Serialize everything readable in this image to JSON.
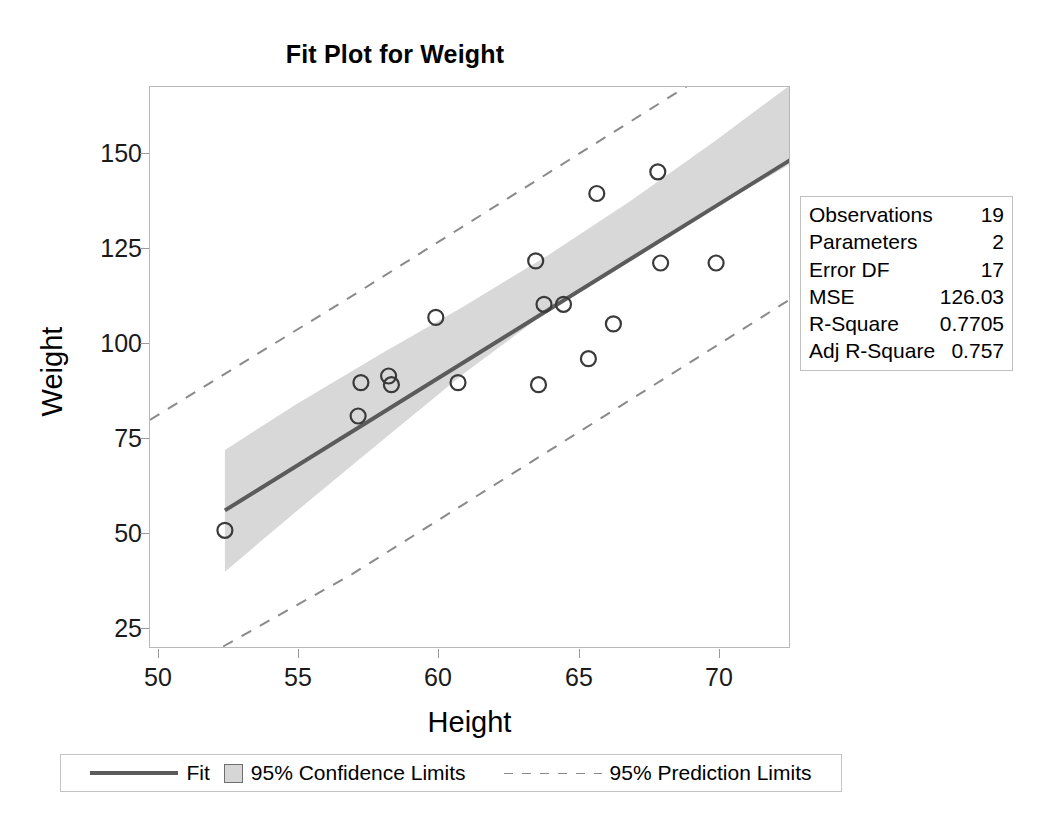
{
  "chart_data": {
    "type": "scatter",
    "title": "Fit Plot for Weight",
    "xlabel": "Height",
    "ylabel": "Weight",
    "xlim": [
      48.7,
      71.8
    ],
    "ylim": [
      23.2,
      152.5
    ],
    "xticks": [
      50,
      55,
      60,
      65,
      70
    ],
    "yticks": [
      25,
      50,
      75,
      100,
      125,
      150
    ],
    "grid": false,
    "legend_position": "bottom",
    "x": [
      51.4,
      56.2,
      56.3,
      57.3,
      57.4,
      59.0,
      59.8,
      62.6,
      62.7,
      62.9,
      63.6,
      64.5,
      64.8,
      65.4,
      67.0,
      67.1,
      69.1,
      72.1
    ],
    "y": [
      50.5,
      76.8,
      84.5,
      86.0,
      84.0,
      99.5,
      84.5,
      112.5,
      84.0,
      102.5,
      102.5,
      90.0,
      128.0,
      98.0,
      133.0,
      112.0,
      112.0,
      150.0
    ],
    "fit_line": {
      "x": [
        51.4,
        72.1
      ],
      "y": [
        55.1,
        137.0
      ],
      "color": "#5b5b5b"
    },
    "confidence_band": {
      "level": "95%",
      "x": [
        51.4,
        54.0,
        57.0,
        60.0,
        63.0,
        66.0,
        69.0,
        72.1
      ],
      "upper": [
        69.0,
        79.6,
        91.0,
        102.0,
        113.6,
        126.2,
        139.8,
        154.5
      ],
      "lower": [
        41.0,
        55.0,
        70.8,
        86.5,
        100.8,
        113.2,
        124.5,
        136.0
      ],
      "fill": "#d6d6d6"
    },
    "prediction_band": {
      "level": "95%",
      "x": [
        51.4,
        56.0,
        60.0,
        64.0,
        68.0,
        72.1
      ],
      "upper": [
        86.5,
        104.5,
        120.5,
        136.5,
        152.5,
        168.5
      ],
      "lower": [
        24.0,
        40.5,
        56.5,
        72.5,
        88.5,
        105.0
      ],
      "color": "#8a8a8a"
    },
    "marker": {
      "shape": "circle",
      "fill": "none",
      "edge": "#3a3a3a"
    }
  },
  "header": {
    "title": "Fit Plot for Weight"
  },
  "axes": {
    "y_label": "Weight",
    "x_label": "Height",
    "y_ticks": [
      "150",
      "125",
      "100",
      "75",
      "50",
      "25"
    ],
    "x_ticks": [
      "50",
      "55",
      "60",
      "65",
      "70"
    ]
  },
  "stats": {
    "rows": [
      {
        "label": "Observations",
        "value": "19"
      },
      {
        "label": "Parameters",
        "value": "2"
      },
      {
        "label": "Error DF",
        "value": "17"
      },
      {
        "label": "MSE",
        "value": "126.03"
      },
      {
        "label": "R-Square",
        "value": "0.7705"
      },
      {
        "label": "Adj R-Square",
        "value": "0.757"
      }
    ]
  },
  "legend": {
    "fit_label": "Fit",
    "confidence_label": "95% Confidence Limits",
    "prediction_label": "95% Prediction Limits"
  }
}
